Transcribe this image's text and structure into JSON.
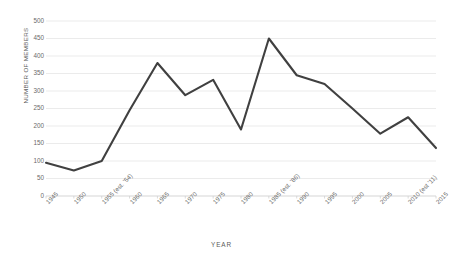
{
  "chart_data": {
    "type": "line",
    "title": "",
    "xlabel": "YEAR",
    "ylabel": "NUMBER OF MEMBERS",
    "categories": [
      "1945",
      "1950",
      "1955 (est. '54)",
      "1960",
      "1965",
      "1970",
      "1975",
      "1980",
      "1985 (est. '86)",
      "1990",
      "1995",
      "2000",
      "2005",
      "2010 (est '11)",
      "2015"
    ],
    "values": [
      95,
      73,
      100,
      245,
      380,
      288,
      332,
      190,
      450,
      345,
      320,
      250,
      178,
      225,
      137
    ],
    "ylim": [
      0,
      500
    ],
    "ytick_labels": [
      "500",
      "450",
      "400",
      "350",
      "300",
      "250",
      "200",
      "150",
      "100",
      "50",
      "0"
    ],
    "ytick_values": [
      500,
      450,
      400,
      350,
      300,
      250,
      200,
      150,
      100,
      50,
      0
    ],
    "grid": true,
    "legend": "none",
    "series_color": "#404040",
    "grid_color": "#e6e6e6",
    "axis_color": "#d0d0d0",
    "text_color": "#6a6a6a",
    "background": "#ffffff"
  }
}
